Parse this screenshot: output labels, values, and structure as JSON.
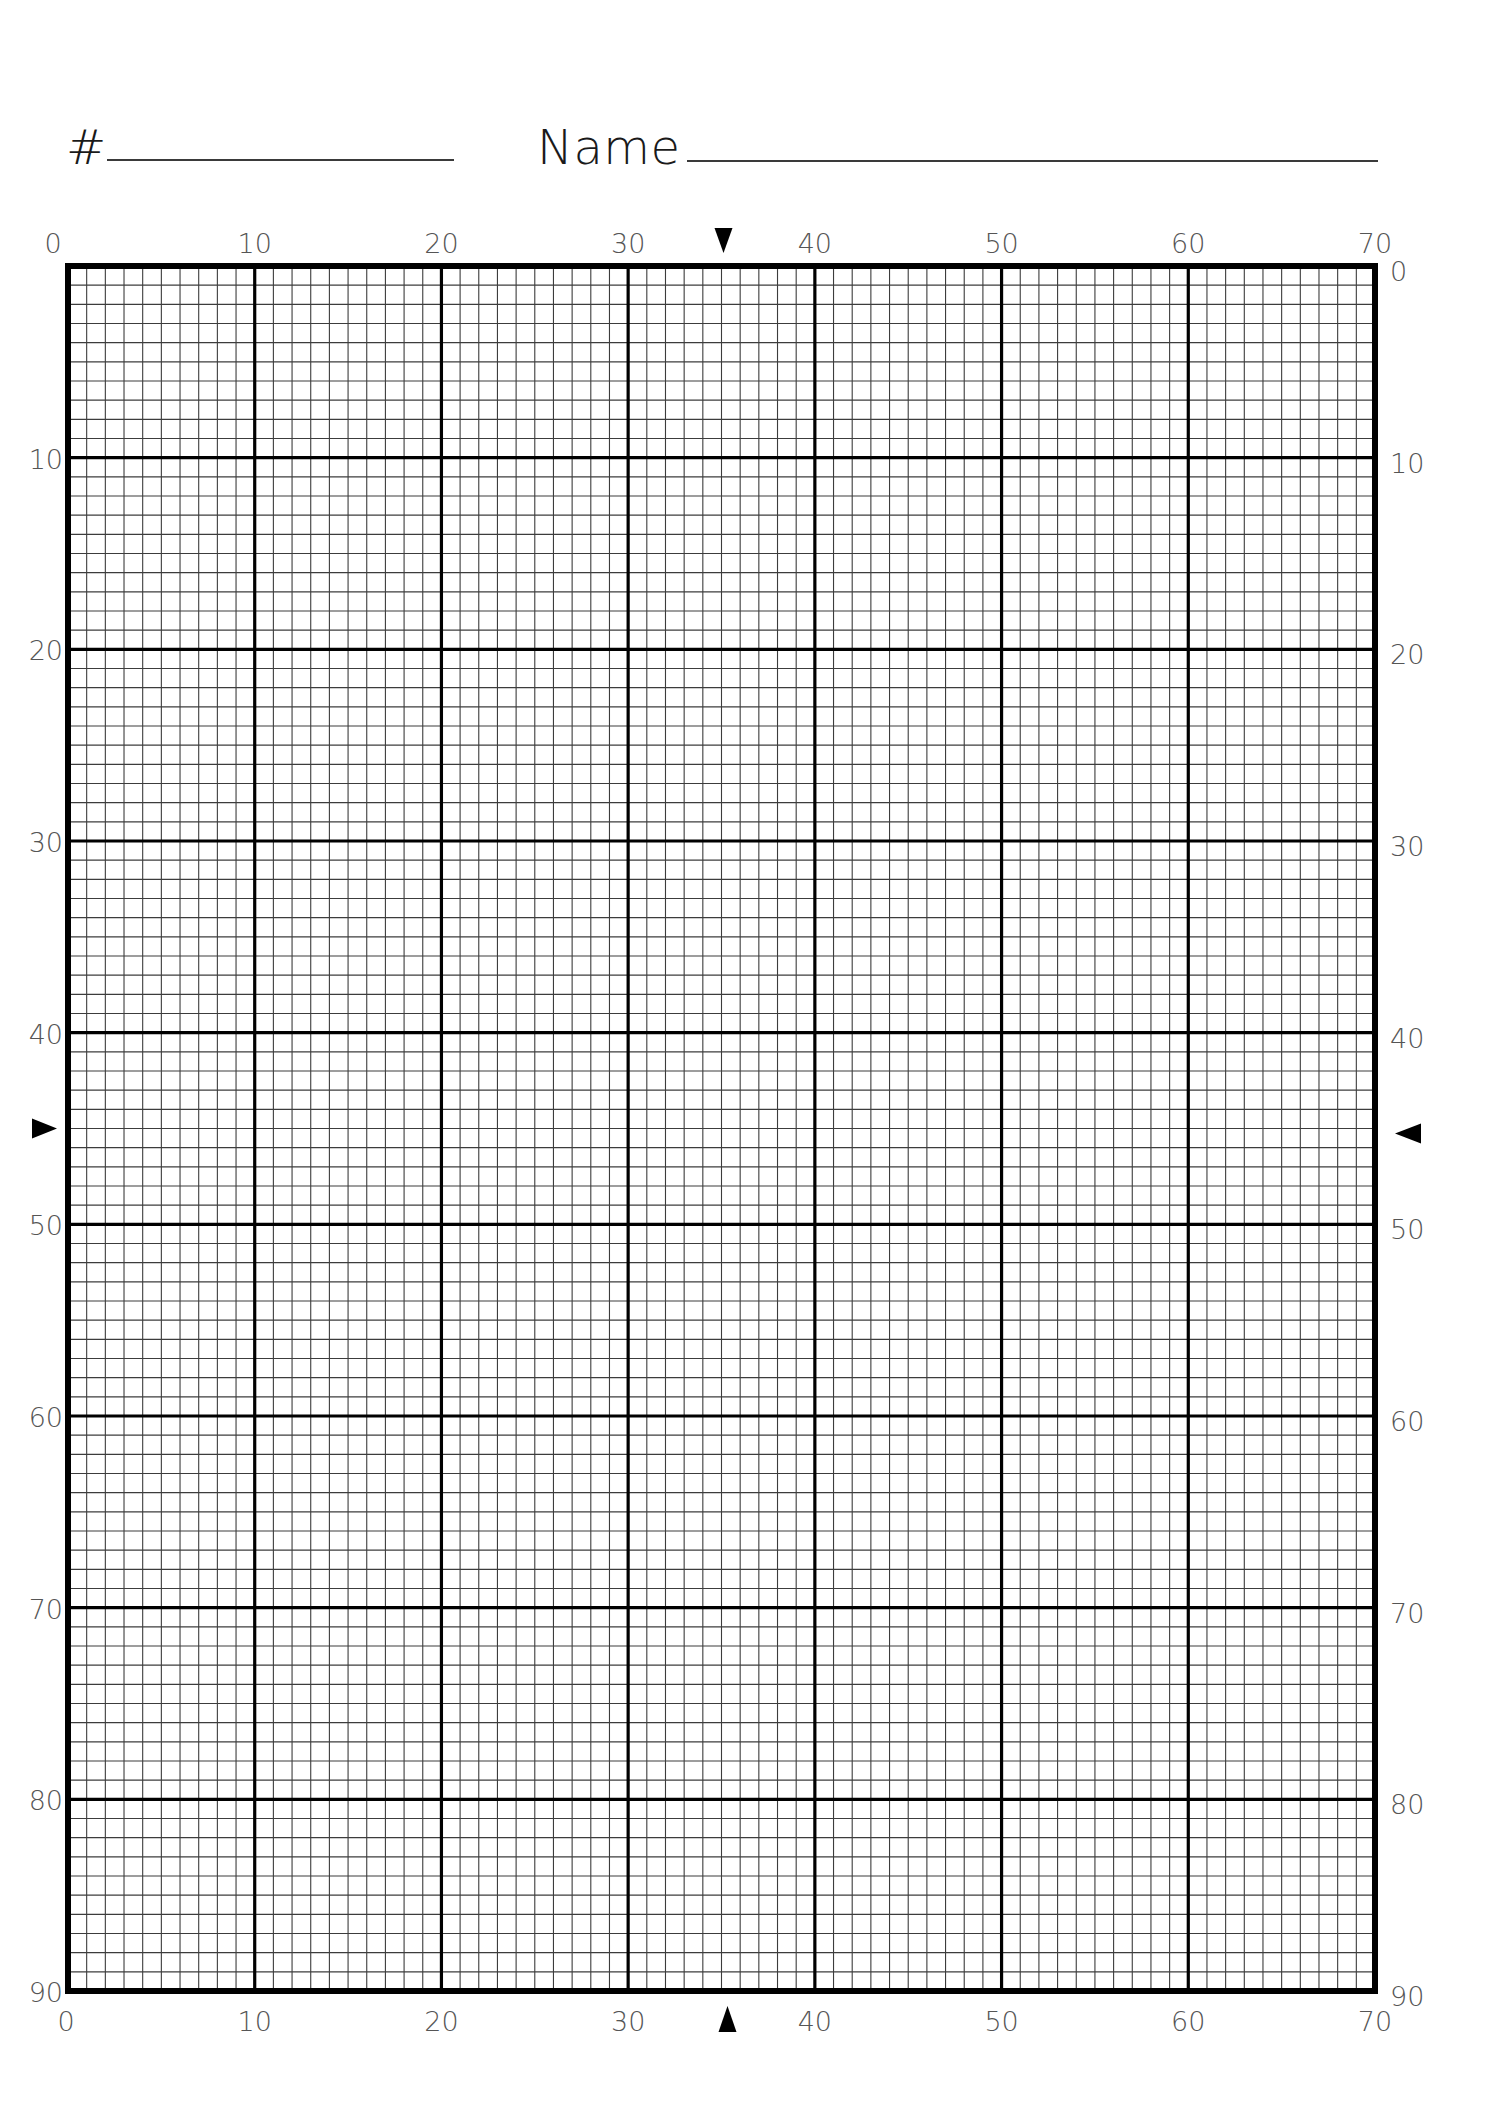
{
  "header": {
    "number_label": "#",
    "number_field": "",
    "name_label": "Name",
    "name_field": ""
  },
  "grid": {
    "columns": 70,
    "rows": 90,
    "major_every": 10,
    "line_color": "#000000",
    "minor_line_color": "#3c3c3c",
    "label_color": "#555555",
    "center_markers": {
      "column": 35,
      "row": 45
    }
  },
  "axis_labels": {
    "top": [
      "0",
      "10",
      "20",
      "30",
      "40",
      "50",
      "60",
      "70"
    ],
    "bottom": [
      "0",
      "10",
      "20",
      "30",
      "40",
      "50",
      "60",
      "70"
    ],
    "left": [
      "10",
      "20",
      "30",
      "40",
      "50",
      "60",
      "70",
      "80",
      "90"
    ],
    "right": [
      "0",
      "10",
      "20",
      "30",
      "40",
      "50",
      "60",
      "70",
      "80",
      "90"
    ]
  },
  "markers": {
    "top": "down-triangle",
    "bottom": "up-triangle",
    "left": "right-triangle",
    "right": "left-triangle"
  }
}
